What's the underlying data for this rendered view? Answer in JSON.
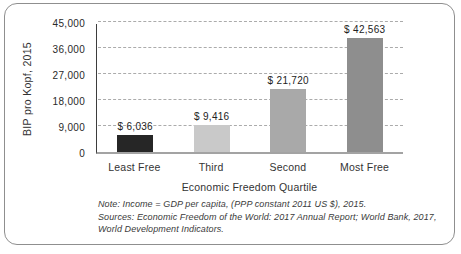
{
  "chart_data": {
    "type": "bar",
    "xlabel": "Economic Freedom Quartile",
    "ylabel": "BIP pro Kopf, 2015",
    "categories": [
      "Least Free",
      "Third",
      "Second",
      "Most Free"
    ],
    "values": [
      6036,
      9416,
      21720,
      42563
    ],
    "value_labels": [
      "$ 6,036",
      "$ 9,416",
      "$ 21,720",
      "$ 42,563"
    ],
    "bar_colors": [
      "#262626",
      "#c9c9c9",
      "#a9a9a9",
      "#8e8e8e"
    ],
    "ylim": [
      0,
      45000
    ],
    "yticks": [
      0,
      9000,
      18000,
      27000,
      36000,
      45000
    ],
    "ytick_labels": [
      "0",
      "9,000",
      "18,000",
      "27,000",
      "36,000",
      "45,000"
    ],
    "grid": "horizontal-dashed",
    "legend": "none"
  },
  "notes": {
    "line1": "Note: Income = GDP per capita, (PPP constant 2011 US $), 2015.",
    "line2": "Sources: Economic Freedom of the World: 2017 Annual Report; World Bank, 2017,",
    "line3": "World Development Indicators."
  }
}
